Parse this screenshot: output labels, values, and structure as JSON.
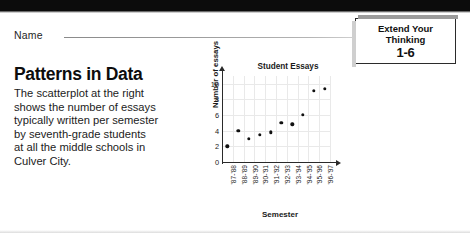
{
  "page": {
    "name_label": "Name"
  },
  "callout": {
    "line1": "Extend Your",
    "line2": "Thinking",
    "number": "1-6"
  },
  "lesson": {
    "headline": "Patterns in Data",
    "body_lines": [
      "The scatterplot at the right",
      "shows the number of essays",
      "typically written per semester",
      "by seventh-grade students",
      "at all the middle schools in",
      "Culver City."
    ]
  },
  "chart_data": {
    "type": "scatter",
    "title": "Student Essays",
    "xlabel": "Semester",
    "ylabel": "Number of essays",
    "categories": [
      "'87-'88",
      "'88-'89",
      "'89-'90",
      "'90-'91",
      "'91-'92",
      "'92-'93",
      "'93-'94",
      "'94-'95",
      "'95-'96",
      "'96-'97"
    ],
    "values": [
      2,
      4,
      3,
      3.5,
      3.8,
      5,
      4.8,
      6,
      9.1,
      9.4
    ],
    "yticks": [
      0,
      2,
      4,
      6,
      8,
      10
    ],
    "ylim": [
      0,
      11
    ],
    "grid": true,
    "legend": "none"
  }
}
